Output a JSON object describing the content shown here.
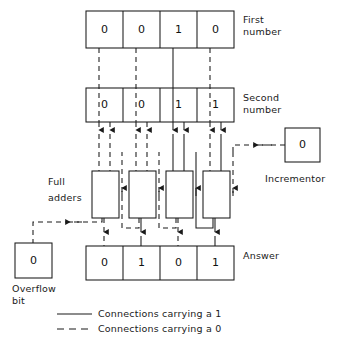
{
  "diagram": {
    "stroke_color": "#1a1a1a",
    "background": "#ffffff"
  },
  "first_number": {
    "label_line1": "First",
    "label_line2": "number",
    "bits": [
      "0",
      "0",
      "1",
      "0"
    ]
  },
  "second_number": {
    "label_line1": "Second",
    "label_line2": "number",
    "bits": [
      "0",
      "0",
      "1",
      "1"
    ]
  },
  "full_adders": {
    "label_line1": "Full",
    "label_line2": "adders",
    "count": 4
  },
  "incrementor": {
    "label": "Incrementor",
    "value": "0"
  },
  "overflow": {
    "label_line1": "Overflow",
    "label_line2": "bit",
    "value": "0"
  },
  "answer": {
    "label": "Answer",
    "bits": [
      "0",
      "1",
      "0",
      "1"
    ]
  },
  "legend": {
    "items": [
      {
        "style": "solid",
        "text": "Connections carrying a 1"
      },
      {
        "style": "dashed",
        "text": "Connections carrying a 0"
      }
    ]
  }
}
